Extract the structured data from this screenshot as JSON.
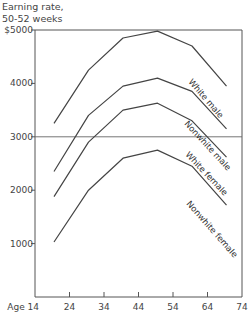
{
  "chart_data": {
    "type": "line",
    "title": "",
    "ylabel": "Earning rate, 50-52 weeks",
    "ylabel_lines": [
      "Earning rate,",
      "50-52 weeks"
    ],
    "xlabel": "Age",
    "x_ticks": [
      "Age 14",
      "24",
      "34",
      "44",
      "54",
      "64",
      "74"
    ],
    "x_tick_values": [
      14,
      24,
      34,
      44,
      54,
      64,
      74
    ],
    "y_ticks": [
      "1000",
      "2000",
      "3000",
      "4000",
      "$5000"
    ],
    "y_tick_values": [
      1000,
      2000,
      3000,
      4000,
      5000
    ],
    "xlim": [
      14,
      74
    ],
    "ylim": [
      0,
      5000
    ],
    "grid": false,
    "reference_line": 3000,
    "x": [
      19.5,
      29.5,
      39.5,
      49.5,
      59.5,
      69.5
    ],
    "series": [
      {
        "name": "White male",
        "values": [
          3250,
          4250,
          4850,
          4980,
          4700,
          3950
        ]
      },
      {
        "name": "Nonwhite male",
        "values": [
          2350,
          3400,
          3950,
          4100,
          3850,
          3150
        ]
      },
      {
        "name": "White female",
        "values": [
          1880,
          2900,
          3500,
          3630,
          3300,
          2620
        ]
      },
      {
        "name": "Nonwhite female",
        "values": [
          1030,
          2000,
          2600,
          2750,
          2450,
          1720
        ]
      }
    ],
    "legend": "inline labels along line ends"
  }
}
